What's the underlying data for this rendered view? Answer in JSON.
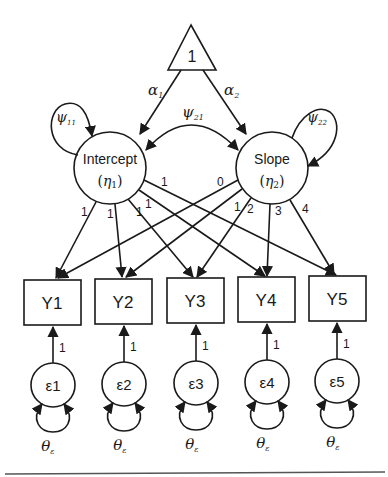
{
  "diagram": {
    "type": "latent growth curve model path diagram",
    "constant": {
      "label": "1"
    },
    "means": {
      "alpha1": "α",
      "alpha1_sub": "1",
      "alpha2": "α",
      "alpha2_sub": "2"
    },
    "latents": [
      {
        "name": "Intercept",
        "symbol": "η",
        "symbol_sub": "1",
        "variance": "ψ",
        "variance_sub": "11"
      },
      {
        "name": "Slope",
        "symbol": "η",
        "symbol_sub": "2",
        "variance": "ψ",
        "variance_sub": "22"
      }
    ],
    "covariance": {
      "label": "ψ",
      "sub": "21"
    },
    "observed": [
      {
        "label": "Y1",
        "intercept_loading": "1",
        "slope_loading": "0"
      },
      {
        "label": "Y2",
        "intercept_loading": "1",
        "slope_loading": "1"
      },
      {
        "label": "Y3",
        "intercept_loading": "1",
        "slope_loading": "2"
      },
      {
        "label": "Y4",
        "intercept_loading": "1",
        "slope_loading": "3"
      },
      {
        "label": "Y5",
        "intercept_loading": "1",
        "slope_loading": "4"
      }
    ],
    "errors": [
      {
        "label": "ε1",
        "loading": "1",
        "variance": "θ",
        "variance_sub": "ε"
      },
      {
        "label": "ε2",
        "loading": "1",
        "variance": "θ",
        "variance_sub": "ε"
      },
      {
        "label": "ε3",
        "loading": "1",
        "variance": "θ",
        "variance_sub": "ε"
      },
      {
        "label": "ε4",
        "loading": "1",
        "variance": "θ",
        "variance_sub": "ε"
      },
      {
        "label": "ε5",
        "loading": "1",
        "variance": "θ",
        "variance_sub": "ε"
      }
    ]
  }
}
